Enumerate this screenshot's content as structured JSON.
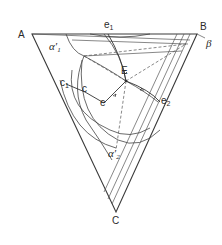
{
  "diagram": {
    "type": "ternary-phase-diagram",
    "vertices": {
      "A": {
        "label": "A"
      },
      "B": {
        "label": "B"
      },
      "C": {
        "label": "C"
      }
    },
    "phase_regions": {
      "alpha1": {
        "label": "α",
        "prime": "′",
        "sub": "1"
      },
      "alpha2": {
        "label": "α",
        "prime": "′",
        "sub": "2"
      },
      "beta": {
        "label": "β"
      }
    },
    "points": {
      "e1": {
        "label": "e",
        "sub": "1"
      },
      "e2": {
        "label": "e",
        "sub": "2"
      },
      "E": {
        "label": "E"
      },
      "c1": {
        "label": "c",
        "sub": "1"
      },
      "c": {
        "label": "c"
      },
      "e": {
        "label": "e"
      }
    },
    "colors": {
      "line": "#3a3a3a",
      "background": "#ffffff"
    }
  }
}
